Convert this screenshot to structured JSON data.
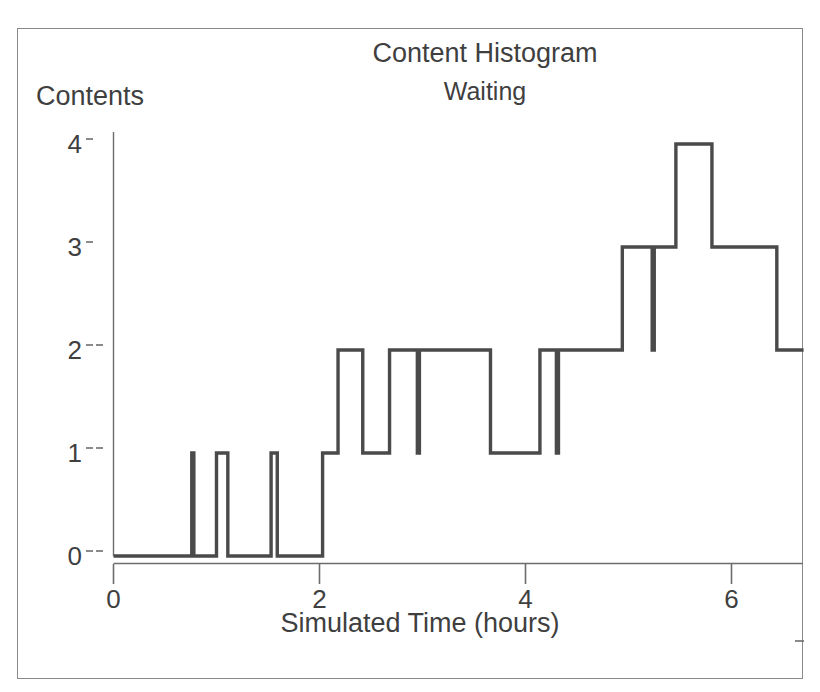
{
  "page": {
    "background": "#ffffff",
    "frame_color": "#8a8a8a",
    "ink_color": "#4a4a4a"
  },
  "header": {
    "title": "Content Histogram",
    "subtitle": "Waiting"
  },
  "axes": {
    "y_axis_label": "Contents",
    "x_axis_label": "Simulated Time (hours)",
    "y_ticks": [
      "0",
      "1",
      "2",
      "3",
      "4"
    ],
    "x_ticks": [
      "0",
      "2",
      "4",
      "6"
    ]
  },
  "chart_data": {
    "type": "line",
    "step": "post",
    "title": "Content Histogram",
    "subtitle": "Waiting",
    "xlabel": "Simulated Time (hours)",
    "ylabel": "Contents",
    "xlim": [
      0,
      6.7
    ],
    "ylim": [
      0,
      4.35
    ],
    "xticks": [
      0,
      2,
      4,
      6
    ],
    "yticks": [
      0,
      1,
      2,
      3,
      4
    ],
    "grid": false,
    "legend": false,
    "series": [
      {
        "name": "Waiting",
        "color": "#4a4a4a",
        "points": [
          [
            0.0,
            0
          ],
          [
            0.76,
            0
          ],
          [
            0.76,
            1
          ],
          [
            0.78,
            1
          ],
          [
            0.78,
            0
          ],
          [
            1.0,
            0
          ],
          [
            1.0,
            1
          ],
          [
            1.11,
            1
          ],
          [
            1.11,
            0
          ],
          [
            1.53,
            0
          ],
          [
            1.53,
            1
          ],
          [
            1.59,
            1
          ],
          [
            1.59,
            0
          ],
          [
            2.03,
            0
          ],
          [
            2.03,
            1
          ],
          [
            2.18,
            1
          ],
          [
            2.18,
            2
          ],
          [
            2.42,
            2
          ],
          [
            2.42,
            1
          ],
          [
            2.68,
            1
          ],
          [
            2.68,
            2
          ],
          [
            2.95,
            2
          ],
          [
            2.95,
            1
          ],
          [
            2.97,
            1
          ],
          [
            2.97,
            2
          ],
          [
            3.66,
            2
          ],
          [
            3.66,
            1
          ],
          [
            4.14,
            1
          ],
          [
            4.14,
            2
          ],
          [
            4.3,
            2
          ],
          [
            4.3,
            1
          ],
          [
            4.32,
            1
          ],
          [
            4.32,
            2
          ],
          [
            4.94,
            2
          ],
          [
            4.94,
            3
          ],
          [
            5.23,
            3
          ],
          [
            5.23,
            2
          ],
          [
            5.25,
            2
          ],
          [
            5.25,
            3
          ],
          [
            5.46,
            3
          ],
          [
            5.46,
            4
          ],
          [
            5.81,
            4
          ],
          [
            5.81,
            3
          ],
          [
            6.44,
            3
          ],
          [
            6.44,
            2
          ],
          [
            6.7,
            2
          ]
        ]
      }
    ]
  }
}
